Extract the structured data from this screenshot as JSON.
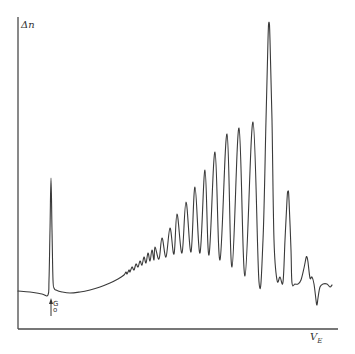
{
  "chart_data": {
    "type": "line",
    "title": "",
    "xlabel": "V_E",
    "ylabel": "Δn",
    "xlabel_main": "V",
    "xlabel_sub": "E",
    "grid": false,
    "legend": null,
    "ticks": {
      "x": [],
      "y": []
    },
    "annotation": {
      "text_top": "G",
      "text_bottom": "o",
      "label": "G₀",
      "type": "upward-arrow",
      "x_px": 51
    },
    "note": "Pixel-coordinate trace of spectrum: x/y are screen pixels (y grows downward); no numeric axis scale is shown.",
    "axes_px": {
      "origin": [
        18,
        329
      ],
      "x_end": 338,
      "y_top": 17
    },
    "points": [
      [
        18,
        291
      ],
      [
        30,
        292
      ],
      [
        42,
        294
      ],
      [
        48,
        295
      ],
      [
        49,
        280
      ],
      [
        50,
        230
      ],
      [
        51,
        178
      ],
      [
        52,
        230
      ],
      [
        53,
        280
      ],
      [
        54,
        288
      ],
      [
        56,
        290
      ],
      [
        62,
        292
      ],
      [
        70,
        293
      ],
      [
        80,
        292
      ],
      [
        90,
        290
      ],
      [
        100,
        287
      ],
      [
        110,
        283
      ],
      [
        118,
        279
      ],
      [
        124,
        275
      ],
      [
        126,
        272
      ],
      [
        127,
        274
      ],
      [
        129,
        270
      ],
      [
        130,
        272
      ],
      [
        132,
        267
      ],
      [
        134,
        270
      ],
      [
        136,
        264
      ],
      [
        138,
        267
      ],
      [
        140,
        261
      ],
      [
        142,
        265
      ],
      [
        144,
        257
      ],
      [
        146,
        263
      ],
      [
        148,
        253
      ],
      [
        150,
        261
      ],
      [
        152,
        250
      ],
      [
        154,
        260
      ],
      [
        155,
        247
      ],
      [
        159,
        259
      ],
      [
        162,
        238
      ],
      [
        166,
        257
      ],
      [
        170,
        228
      ],
      [
        174,
        254
      ],
      [
        177,
        214
      ],
      [
        182,
        253
      ],
      [
        186,
        202
      ],
      [
        191,
        252
      ],
      [
        195,
        187
      ],
      [
        200,
        253
      ],
      [
        205,
        170
      ],
      [
        209,
        255
      ],
      [
        215,
        152
      ],
      [
        220,
        260
      ],
      [
        227,
        134
      ],
      [
        232,
        267
      ],
      [
        239,
        128
      ],
      [
        245,
        276
      ],
      [
        253,
        122
      ],
      [
        259,
        282
      ],
      [
        263,
        240
      ],
      [
        266,
        120
      ],
      [
        268,
        40
      ],
      [
        269,
        22
      ],
      [
        270,
        40
      ],
      [
        272,
        120
      ],
      [
        274,
        240
      ],
      [
        277,
        280
      ],
      [
        280,
        277
      ],
      [
        283,
        282
      ],
      [
        285,
        240
      ],
      [
        287,
        200
      ],
      [
        288,
        191
      ],
      [
        289,
        200
      ],
      [
        291,
        250
      ],
      [
        292,
        283
      ],
      [
        295,
        284
      ],
      [
        298,
        284
      ],
      [
        301,
        280
      ],
      [
        304,
        268
      ],
      [
        306,
        258
      ],
      [
        307,
        257
      ],
      [
        308,
        262
      ],
      [
        310,
        278
      ],
      [
        312,
        277
      ],
      [
        314,
        284
      ],
      [
        316,
        300
      ],
      [
        317,
        305
      ],
      [
        318,
        298
      ],
      [
        320,
        287
      ],
      [
        323,
        284
      ],
      [
        327,
        284
      ],
      [
        330,
        287
      ],
      [
        332,
        285
      ]
    ]
  }
}
